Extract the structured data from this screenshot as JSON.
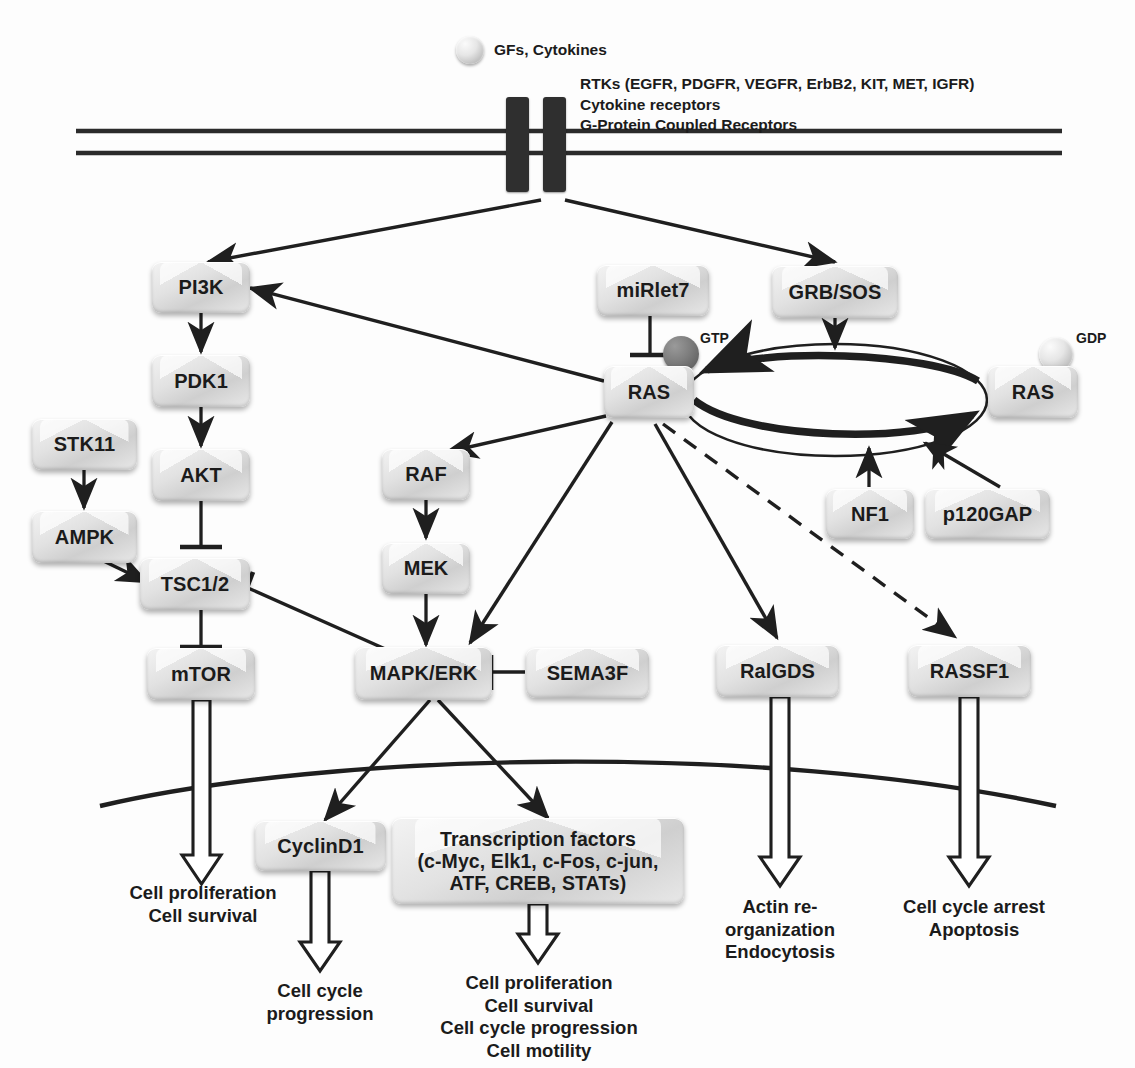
{
  "diagram": {
    "ligand_label": "GFs, Cytokines",
    "receptor_label": "RTKs (EGFR, PDGFR, VEGFR, ErbB2, KIT, MET, IGFR)\nCytokine receptors\nG-Protein Coupled Receptors",
    "nucleotide_gtp": "GTP",
    "nucleotide_gdp": "GDP",
    "colors": {
      "line": "#1f1f1f",
      "node_face": "#dcdcdc",
      "node_edge": "#b5b5b5",
      "text": "#1b1b1b",
      "membrane": "#2b2b2b",
      "gtp_ball": "#6f6f6f",
      "gdp_ball": "#e2e2e2"
    }
  },
  "nodes": [
    {
      "id": "pi3k",
      "label": "PI3K"
    },
    {
      "id": "pdk1",
      "label": "PDK1"
    },
    {
      "id": "akt",
      "label": "AKT"
    },
    {
      "id": "stk11",
      "label": "STK11"
    },
    {
      "id": "ampk",
      "label": "AMPK"
    },
    {
      "id": "tsc12",
      "label": "TSC1/2"
    },
    {
      "id": "mtor",
      "label": "mTOR"
    },
    {
      "id": "mirlet7",
      "label": "miRlet7"
    },
    {
      "id": "ras_gtp",
      "label": "RAS"
    },
    {
      "id": "ras_gdp",
      "label": "RAS"
    },
    {
      "id": "grbsos",
      "label": "GRB/SOS"
    },
    {
      "id": "nf1",
      "label": "NF1"
    },
    {
      "id": "p120gap",
      "label": "p120GAP"
    },
    {
      "id": "raf",
      "label": "RAF"
    },
    {
      "id": "mek",
      "label": "MEK"
    },
    {
      "id": "mapkerk",
      "label": "MAPK/ERK"
    },
    {
      "id": "sema3f",
      "label": "SEMA3F"
    },
    {
      "id": "ralgds",
      "label": "RalGDS"
    },
    {
      "id": "rassf1",
      "label": "RASSF1"
    },
    {
      "id": "cyclind1",
      "label": "CyclinD1"
    },
    {
      "id": "tfactors",
      "label": "Transcription factors\n(c-Myc, Elk1, c-Fos, c-jun,\nATF, CREB, STATs)"
    }
  ],
  "outcomes": [
    {
      "id": "out_mtor",
      "text": "Cell proliferation\nCell survival"
    },
    {
      "id": "out_cyclin",
      "text": "Cell cycle\nprogression"
    },
    {
      "id": "out_tf",
      "text": "Cell proliferation\nCell survival\nCell cycle progression\nCell motility"
    },
    {
      "id": "out_ralgds",
      "text": "Actin re-\norganization\nEndocytosis"
    },
    {
      "id": "out_rassf1",
      "text": "Cell cycle arrest\nApoptosis"
    }
  ],
  "edges": [
    {
      "from": "receptor",
      "to": "pi3k",
      "type": "activation"
    },
    {
      "from": "receptor",
      "to": "grbsos",
      "type": "activation"
    },
    {
      "from": "pi3k",
      "to": "pdk1",
      "type": "activation"
    },
    {
      "from": "pdk1",
      "to": "akt",
      "type": "activation"
    },
    {
      "from": "akt",
      "to": "tsc12",
      "type": "inhibition"
    },
    {
      "from": "stk11",
      "to": "ampk",
      "type": "activation"
    },
    {
      "from": "ampk",
      "to": "tsc12",
      "type": "activation"
    },
    {
      "from": "tsc12",
      "to": "mtor",
      "type": "inhibition"
    },
    {
      "from": "mtor",
      "to": "out_mtor",
      "type": "outcome"
    },
    {
      "from": "mirlet7",
      "to": "ras_gtp",
      "type": "inhibition"
    },
    {
      "from": "grbsos",
      "to": "ras_cycle",
      "type": "activation"
    },
    {
      "from": "nf1",
      "to": "ras_cycle",
      "type": "activation"
    },
    {
      "from": "p120gap",
      "to": "ras_cycle",
      "type": "activation"
    },
    {
      "from": "ras_gtp",
      "to": "pi3k",
      "type": "activation"
    },
    {
      "from": "ras_gtp",
      "to": "raf",
      "type": "activation"
    },
    {
      "from": "ras_gtp",
      "to": "mapkerk",
      "type": "activation"
    },
    {
      "from": "ras_gtp",
      "to": "ralgds",
      "type": "activation"
    },
    {
      "from": "ras_gtp",
      "to": "rassf1",
      "type": "dashed"
    },
    {
      "from": "ras_gtp",
      "to": "tsc12",
      "type": "inhibition"
    },
    {
      "from": "raf",
      "to": "mek",
      "type": "activation"
    },
    {
      "from": "mek",
      "to": "mapkerk",
      "type": "activation"
    },
    {
      "from": "sema3f",
      "to": "mapkerk",
      "type": "inhibition"
    },
    {
      "from": "mapkerk",
      "to": "cyclind1",
      "type": "activation"
    },
    {
      "from": "mapkerk",
      "to": "tfactors",
      "type": "activation"
    },
    {
      "from": "cyclind1",
      "to": "out_cyclin",
      "type": "outcome"
    },
    {
      "from": "tfactors",
      "to": "out_tf",
      "type": "outcome"
    },
    {
      "from": "ralgds",
      "to": "out_ralgds",
      "type": "outcome"
    },
    {
      "from": "rassf1",
      "to": "out_rassf1",
      "type": "outcome"
    }
  ]
}
